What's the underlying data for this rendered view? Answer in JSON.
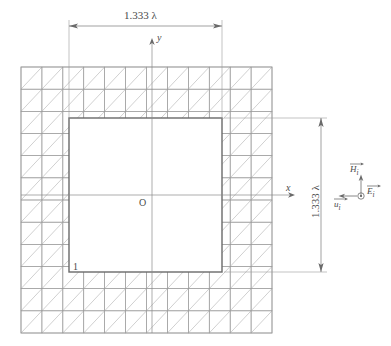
{
  "figure": {
    "type": "fdtd-mesh-cross-section",
    "dimensions": {
      "top_label": "1.333 λ",
      "right_label": "1.333 λ"
    },
    "axes": {
      "y_label": "y",
      "x_label": "x",
      "origin_label": "O"
    },
    "node_label": "1",
    "vectors": {
      "h_label": "H",
      "h_sub": "i",
      "e_label": "E",
      "e_sub": "i",
      "u_label": "u",
      "u_sub": "i"
    },
    "colors": {
      "mesh_line": "#9a9a9a",
      "mesh_diagonal": "#b0b0b0",
      "boundary": "#6a6a6a",
      "dimension": "#7a7a7a",
      "axis": "#8a8a8a",
      "text": "#4a4a4a"
    },
    "geometry": {
      "mesh_left": 21,
      "mesh_top": 67,
      "mesh_right": 272,
      "mesh_bottom": 333,
      "cells_x": 12,
      "cells_y": 12,
      "inner_left": 69,
      "inner_top": 118,
      "inner_right": 222,
      "inner_bottom": 272
    }
  }
}
